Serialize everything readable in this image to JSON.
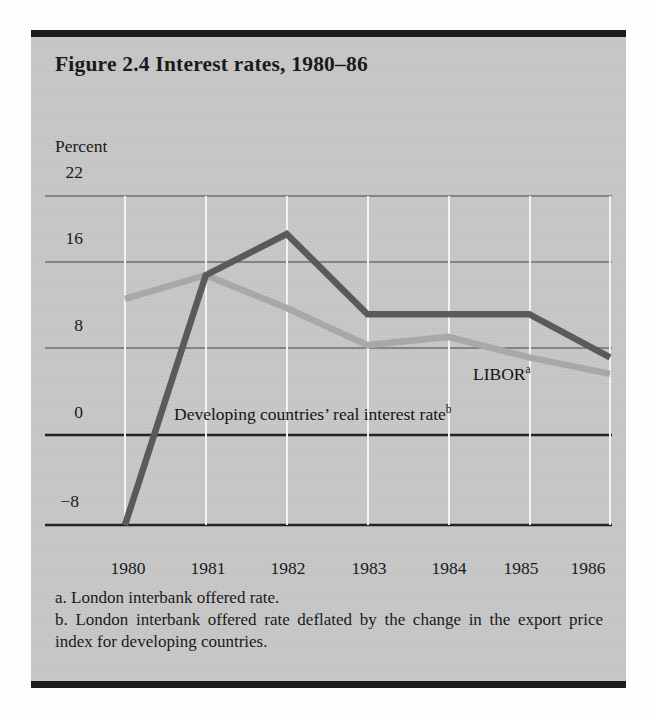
{
  "figure": {
    "title": "Figure 2.4 Interest rates, 1980–86",
    "axis_unit_label": "Percent"
  },
  "notes": {
    "a": "a. London interbank offered rate.",
    "b": "b. London interbank offered rate deflated by the change in the export price index for developing countries."
  },
  "series_labels": {
    "libor": "LIBOR",
    "libor_sup": "a",
    "developing": "Developing countries’ real interest rate",
    "developing_sup": "b"
  },
  "colors": {
    "panel_background": "#c9c9c9",
    "rule": "#1d1d1d",
    "developing_line": "#5a5a5a",
    "libor_line": "#a8a8a8",
    "gridline_horizontal": "#6e6e6e",
    "gridline_vertical": "#f2f2f2",
    "zero_line": "#232323",
    "text": "#1a1a1a"
  },
  "chart_data": {
    "type": "line",
    "title": "Figure 2.4 Interest rates, 1980–86",
    "xlabel": "",
    "ylabel": "Percent",
    "x": [
      1980,
      1981,
      1982,
      1983,
      1984,
      1985,
      1986
    ],
    "xticklabels": [
      "1980",
      "1981",
      "1982",
      "1983",
      "1984",
      "1985",
      "1986"
    ],
    "yticks": [
      22,
      16,
      8,
      0,
      -8
    ],
    "yticklabels": [
      "22",
      "16",
      "8",
      "0",
      "−8"
    ],
    "ylim": [
      -8,
      24
    ],
    "xlim": [
      1980,
      1986
    ],
    "grid": "horizontal gridlines at 22, 16, 8 and a heavy zero line; faint white vertical gridlines at each year",
    "legend": "inline labels inside plot area",
    "series": [
      {
        "name": "LIBOR",
        "note": "a",
        "color": "#a8a8a8",
        "values": [
          14.0,
          16.3,
          13.1,
          9.5,
          10.3,
          8.3,
          6.7
        ]
      },
      {
        "name": "Developing countries’ real interest rate",
        "note": "b",
        "color": "#5a5a5a",
        "values": [
          -8.0,
          16.3,
          20.3,
          12.5,
          12.5,
          12.5,
          8.3
        ]
      }
    ],
    "annotations": [
      {
        "text": "LIBOR",
        "superscript": "a",
        "x": 1985.0,
        "y": 7.0
      },
      {
        "text": "Developing countries’ real interest rate",
        "superscript": "b",
        "x": 1980.6,
        "y": 2.3
      }
    ]
  }
}
